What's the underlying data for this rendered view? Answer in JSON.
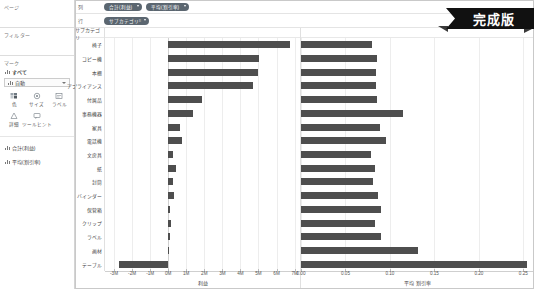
{
  "app": {
    "badge_label": "完成版",
    "bar_color": "#4e4e4e",
    "pill_color": "#5b6670",
    "grid_color": "#ededed"
  },
  "sidebar": {
    "pages": {
      "title": "ページ"
    },
    "filters": {
      "title": "フィルター"
    },
    "marks": {
      "title": "マーク",
      "all_label": "すべて",
      "mark_type": "自動",
      "buttons": [
        {
          "name": "color",
          "label": "色",
          "icon": "color-palette-icon"
        },
        {
          "name": "size",
          "label": "サイズ",
          "icon": "size-circle-icon"
        },
        {
          "name": "label",
          "label": "ラベル",
          "icon": "label-tag-icon"
        },
        {
          "name": "detail",
          "label": "詳細",
          "icon": "detail-icon"
        },
        {
          "name": "tooltip",
          "label": "ツールヒント",
          "icon": "tooltip-icon"
        }
      ],
      "fields": [
        {
          "label": "合計(利益)",
          "icon": "bar-measure-icon"
        },
        {
          "label": "平均(割引率)",
          "icon": "bar-measure-icon"
        }
      ]
    }
  },
  "shelves": {
    "columns_label": "列",
    "rows_label": "行",
    "columns_pills": [
      {
        "label": "合計(利益)"
      },
      {
        "label": "平均(割引率)"
      }
    ],
    "rows_pills": [
      {
        "label": "サブカテゴリ"
      }
    ]
  },
  "chart_data": {
    "type": "bar",
    "title": "",
    "row_header_title": "サブカテゴリ",
    "categories": [
      "椅子",
      "コピー機",
      "本棚",
      "アプライアンス",
      "付属品",
      "事務機器",
      "家具",
      "電話機",
      "文房具",
      "紙",
      "封筒",
      "バインダー",
      "保管箱",
      "クリップ",
      "ラベル",
      "画材",
      "テーブル"
    ],
    "panes": [
      {
        "name": "profit",
        "xlabel": "利益",
        "ticks": [
          "-3M",
          "-2M",
          "-1M",
          "0M",
          "1M",
          "2M",
          "3M",
          "4M",
          "5M",
          "6M",
          "7M"
        ],
        "tick_values": [
          -3,
          -2,
          -1,
          0,
          1,
          2,
          3,
          4,
          5,
          6,
          7
        ],
        "xlim": [
          -3.5,
          7.3
        ],
        "unit": "M",
        "values": [
          6.72,
          5.05,
          4.95,
          4.72,
          1.88,
          1.35,
          0.68,
          0.74,
          0.28,
          0.46,
          0.27,
          0.3,
          0.09,
          0.13,
          0.11,
          0.06,
          -2.72
        ]
      },
      {
        "name": "discount",
        "xlabel": "平均 割引率",
        "ticks": [
          "0.00",
          "0.05",
          "0.10",
          "0.15",
          "0.20",
          "0.25"
        ],
        "tick_values": [
          0.0,
          0.05,
          0.1,
          0.15,
          0.2,
          0.25
        ],
        "xlim": [
          0.0,
          0.262
        ],
        "values": [
          0.0795,
          0.086,
          0.084,
          0.0845,
          0.0855,
          0.115,
          0.089,
          0.0955,
          0.079,
          0.0835,
          0.0805,
          0.087,
          0.0905,
          0.0835,
          0.0895,
          0.131,
          0.254
        ]
      }
    ],
    "grid": true,
    "legend": "none"
  }
}
